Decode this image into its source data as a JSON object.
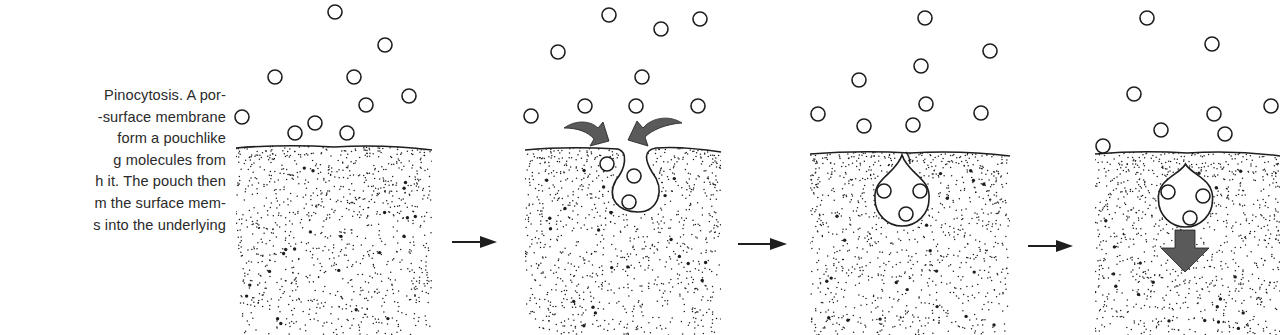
{
  "figure": {
    "title": "Pinocytosis",
    "caption_lines": [
      "Pinocytosis. A por-",
      "-surface membrane",
      "form a pouchlike",
      "g molecules from",
      "h it. The pouch then",
      "m the surface mem-",
      "s into the underlying"
    ],
    "colors": {
      "ink": "#1e1e1e",
      "arrow_fill": "#5a5a5a",
      "background": "#ffffff"
    }
  },
  "panels": [
    {
      "id": "stage-1",
      "label": "Molecules contact the cell surface",
      "x": 236,
      "width": 196,
      "membrane_y": 148,
      "bottom": 335,
      "molecules": [
        [
          335,
          12
        ],
        [
          385,
          45
        ],
        [
          275,
          77
        ],
        [
          354,
          77
        ],
        [
          409,
          96
        ],
        [
          366,
          105
        ],
        [
          242,
          117
        ],
        [
          315,
          123
        ],
        [
          295,
          133
        ],
        [
          347,
          133
        ]
      ],
      "pouch": "none"
    },
    {
      "id": "stage-2",
      "label": "Membrane invaginates forming a pouch",
      "x": 525,
      "width": 196,
      "membrane_y": 150,
      "bottom": 335,
      "molecules": [
        [
          609,
          15
        ],
        [
          661,
          29
        ],
        [
          700,
          19
        ],
        [
          558,
          52
        ],
        [
          642,
          77
        ],
        [
          585,
          106
        ],
        [
          636,
          106
        ],
        [
          698,
          106
        ],
        [
          531,
          116
        ]
      ],
      "pouch_molecules": [
        [
          607,
          164
        ],
        [
          634,
          176
        ],
        [
          629,
          202
        ]
      ],
      "pouch": "open",
      "curved_arrows": true
    },
    {
      "id": "stage-3",
      "label": "Pouch pinches off from surface",
      "x": 810,
      "width": 200,
      "membrane_y": 154,
      "bottom": 335,
      "molecules": [
        [
          925,
          18
        ],
        [
          990,
          51
        ],
        [
          921,
          66
        ],
        [
          859,
          80
        ],
        [
          926,
          104
        ],
        [
          981,
          113
        ],
        [
          818,
          114
        ],
        [
          864,
          126
        ],
        [
          913,
          125
        ]
      ],
      "pouch_molecules": [
        [
          884,
          191
        ],
        [
          920,
          191
        ],
        [
          906,
          214
        ]
      ],
      "pouch": "closed"
    },
    {
      "id": "stage-4",
      "label": "Vesicle moves into the underlying cytoplasm",
      "x": 1095,
      "width": 185,
      "membrane_y": 154,
      "bottom": 335,
      "molecules": [
        [
          1147,
          18
        ],
        [
          1212,
          44
        ],
        [
          1134,
          94
        ],
        [
          1214,
          114
        ],
        [
          1271,
          106
        ],
        [
          1161,
          130
        ],
        [
          1225,
          134
        ],
        [
          1103,
          146
        ]
      ],
      "pouch_molecules": [
        [
          1168,
          192
        ],
        [
          1203,
          196
        ],
        [
          1190,
          218
        ]
      ],
      "pouch": "vesicle",
      "down_arrow": true
    }
  ],
  "step_arrows": [
    {
      "id": "arrow-1-2",
      "x1": 452,
      "x2": 497,
      "y": 242
    },
    {
      "id": "arrow-2-3",
      "x1": 738,
      "x2": 787,
      "y": 244
    },
    {
      "id": "arrow-3-4",
      "x1": 1028,
      "x2": 1073,
      "y": 246
    }
  ]
}
